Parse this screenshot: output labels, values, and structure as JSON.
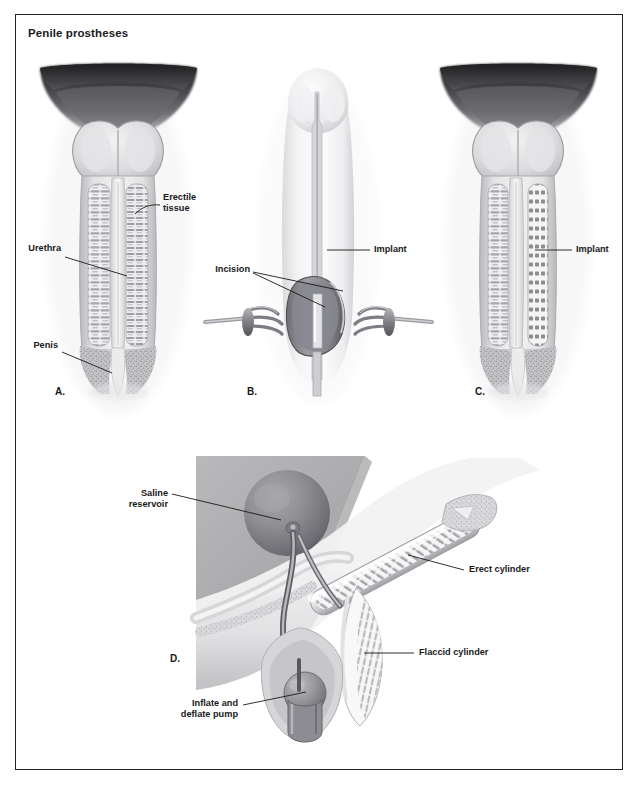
{
  "figure": {
    "title": "Penile prostheses",
    "border_color": "#231f20",
    "background": "#ffffff",
    "ink_color": "#1a1a1a"
  },
  "panels": [
    {
      "id": "A",
      "letter": "A.",
      "caption": "Cross-section of normal penis showing erectile tissue and urethra",
      "labels": [
        {
          "name": "erectile-tissue",
          "text": "Erectile\ntissue"
        },
        {
          "name": "urethra",
          "text": "Urethra"
        },
        {
          "name": "penis",
          "text": "Penis"
        }
      ]
    },
    {
      "id": "B",
      "letter": "B.",
      "caption": "Surgical incision with retractors and implant insertion",
      "labels": [
        {
          "name": "incision",
          "text": "Incision"
        },
        {
          "name": "implant",
          "text": "Implant"
        }
      ]
    },
    {
      "id": "C",
      "letter": "C.",
      "caption": "Cross-section showing semi-rigid implant in place",
      "labels": [
        {
          "name": "implant",
          "text": "Implant"
        }
      ]
    },
    {
      "id": "D",
      "letter": "D.",
      "caption": "Inflatable three-piece prosthesis with reservoir, pump and cylinders",
      "labels": [
        {
          "name": "saline-reservoir",
          "text": "Saline\nreservoir"
        },
        {
          "name": "erect-cylinder",
          "text": "Erect cylinder"
        },
        {
          "name": "flaccid-cylinder",
          "text": "Flaccid cylinder"
        },
        {
          "name": "inflate-deflate-pump",
          "text": "Inflate and\ndeflate pump"
        }
      ]
    }
  ],
  "palette": {
    "tissue_light": "#e9e9ea",
    "tissue_mid": "#c9c9cb",
    "tissue_dark": "#8e8e92",
    "shadow": "#5a5a5e",
    "panel_bg_gray": "#b3b3b5",
    "outline": "#9a9a9e"
  }
}
